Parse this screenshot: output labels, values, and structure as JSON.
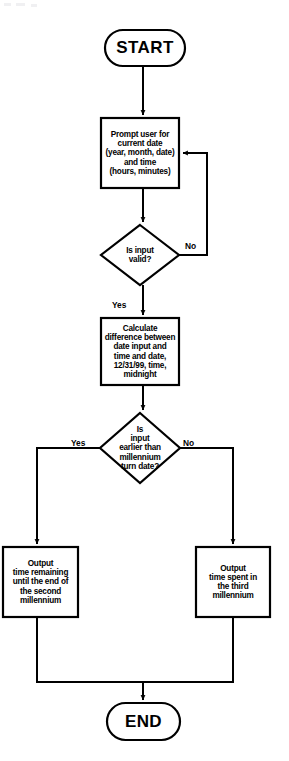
{
  "diagram": {
    "type": "flowchart",
    "background_color": "#ffffff",
    "line_color": "#000000",
    "text_color": "#000000"
  },
  "nodes": {
    "start": {
      "shape": "terminal",
      "label": "START"
    },
    "prompt_input": {
      "shape": "process",
      "label": "Prompt user for\ncurrent date\n(year, month, date)\nand time\n(hours, minutes)"
    },
    "validate": {
      "shape": "decision",
      "label": "Is input\nvalid?"
    },
    "calculate": {
      "shape": "process",
      "label": "Calculate\ndifference between\ndate input and\ntime and date,\n12/31/99, time,\nmidnight"
    },
    "compare_millennium": {
      "shape": "decision",
      "label": "Is\ninput\nearlier than\nmillennium\nturn date?"
    },
    "output_remaining": {
      "shape": "process",
      "label": "Output\ntime remaining\nuntil the end of\nthe second\nmillennium"
    },
    "output_spent": {
      "shape": "process",
      "label": "Output\ntime spent in\nthe third\nmillennium"
    },
    "end": {
      "shape": "terminal",
      "label": "END"
    }
  },
  "edge_labels": {
    "validate_no": "No",
    "validate_yes": "Yes",
    "millennium_yes": "Yes",
    "millennium_no": "No"
  }
}
